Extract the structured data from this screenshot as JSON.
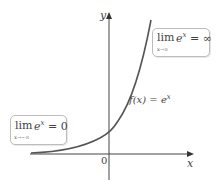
{
  "figure": {
    "axis_x_label": "x",
    "axis_y_label": "y",
    "origin_label": "0",
    "curve_label_lhs": "f(x) = e",
    "curve_label_exp": "x",
    "colors": {
      "axis": "#444444",
      "curve": "#555555",
      "box_border": "#bdbdbd"
    }
  },
  "annotations": {
    "right_box": {
      "lim": "lim",
      "sub": "x→∞",
      "base": "e",
      "exp": "x",
      "rhs": " = ∞"
    },
    "left_box": {
      "lim": "lim",
      "sub": "x→−∞",
      "base": "e",
      "exp": "x",
      "rhs": " = 0"
    }
  }
}
